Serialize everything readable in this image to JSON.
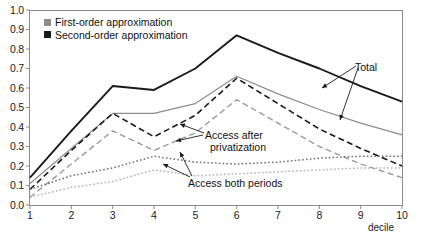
{
  "chart_data": {
    "type": "line",
    "title": "",
    "xlabel": "decile",
    "ylabel": "",
    "x": [
      1,
      2,
      3,
      4,
      5,
      6,
      7,
      8,
      9,
      10
    ],
    "xlim": [
      1,
      10
    ],
    "ylim": [
      0.0,
      1.0
    ],
    "grid": false,
    "legend_position": "top-left",
    "ytick_labels": [
      "1.0",
      "0.9",
      "0.8",
      "0.7",
      "0.6",
      "0.5",
      "0.4",
      "0.3",
      "0.2",
      "0.1",
      "0.0"
    ],
    "ytick_values": [
      1.0,
      0.9,
      0.8,
      0.7,
      0.6,
      0.5,
      0.4,
      0.3,
      0.2,
      0.1,
      0.0
    ],
    "xtick_labels": [
      "1",
      "2",
      "3",
      "4",
      "5",
      "6",
      "7",
      "8",
      "9",
      "10"
    ],
    "series": [
      {
        "name": "Total (second-order approximation)",
        "style": "solid",
        "color": "#1a1a1a",
        "width": 1.9,
        "values": [
          0.14,
          0.38,
          0.61,
          0.59,
          0.7,
          0.87,
          0.78,
          0.7,
          0.61,
          0.53
        ]
      },
      {
        "name": "Total (first-order approximation)",
        "style": "solid",
        "color": "#8c8c8c",
        "width": 1.2,
        "values": [
          0.11,
          0.29,
          0.47,
          0.47,
          0.52,
          0.66,
          0.57,
          0.49,
          0.42,
          0.36
        ]
      },
      {
        "name": "Access after privatization (second-order approximation)",
        "style": "dashed",
        "color": "#1a1a1a",
        "width": 1.6,
        "values": [
          0.08,
          0.28,
          0.47,
          0.35,
          0.46,
          0.65,
          0.52,
          0.39,
          0.29,
          0.2
        ]
      },
      {
        "name": "Access after privatization (first-order approximation)",
        "style": "dashed",
        "color": "#9a9a9a",
        "width": 1.4,
        "values": [
          0.04,
          0.21,
          0.38,
          0.28,
          0.37,
          0.54,
          0.42,
          0.3,
          0.21,
          0.14
        ]
      },
      {
        "name": "Access both periods (second-order approximation)",
        "style": "dotted",
        "color": "#6e6e6e",
        "width": 1.5,
        "values": [
          0.08,
          0.15,
          0.19,
          0.25,
          0.22,
          0.21,
          0.22,
          0.24,
          0.25,
          0.25
        ]
      },
      {
        "name": "Access both periods (first-order approximation)",
        "style": "dotted",
        "color": "#b2b2b2",
        "width": 1.5,
        "values": [
          0.04,
          0.09,
          0.12,
          0.18,
          0.15,
          0.16,
          0.17,
          0.18,
          0.19,
          0.19
        ]
      }
    ],
    "annotations": [
      {
        "text": "Total",
        "x": 8.0,
        "y": 0.74
      },
      {
        "text": "Access after",
        "x": 5.6,
        "y": 0.41
      },
      {
        "text": "privatization",
        "x": 5.7,
        "y": 0.355
      },
      {
        "text": "Access both periods",
        "x": 5.0,
        "y": 0.155
      }
    ]
  },
  "legend": {
    "items": [
      {
        "label": "First-order approximation",
        "color": "#8c8c8c"
      },
      {
        "label": "Second-order approximation",
        "color": "#1a1a1a"
      }
    ]
  },
  "axis": {
    "x_title": "decile"
  },
  "annotations": {
    "total": "Total",
    "access_after_line1": "Access after",
    "access_after_line2": "privatization",
    "access_both": "Access both periods"
  }
}
